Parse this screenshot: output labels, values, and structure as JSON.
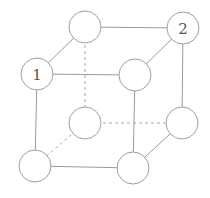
{
  "diagram": {
    "type": "cube-graph",
    "nodes": [
      {
        "id": "back-top-left",
        "x": 85,
        "y": 27,
        "r": 16,
        "label": ""
      },
      {
        "id": "back-top-right",
        "x": 183,
        "y": 28,
        "r": 16,
        "label": "2"
      },
      {
        "id": "front-top-left",
        "x": 37,
        "y": 74,
        "r": 16,
        "label": "1"
      },
      {
        "id": "front-top-right",
        "x": 135,
        "y": 75,
        "r": 16,
        "label": ""
      },
      {
        "id": "back-bottom-left",
        "x": 85,
        "y": 123,
        "r": 16,
        "label": ""
      },
      {
        "id": "back-bottom-right",
        "x": 182,
        "y": 123,
        "r": 16,
        "label": ""
      },
      {
        "id": "front-bottom-left",
        "x": 35,
        "y": 166,
        "r": 16,
        "label": ""
      },
      {
        "id": "front-bottom-right",
        "x": 133,
        "y": 168,
        "r": 16,
        "label": ""
      }
    ],
    "edges": [
      {
        "from": "back-top-left",
        "to": "back-top-right",
        "style": "solid"
      },
      {
        "from": "back-top-left",
        "to": "front-top-left",
        "style": "solid"
      },
      {
        "from": "back-top-right",
        "to": "front-top-right",
        "style": "solid"
      },
      {
        "from": "front-top-left",
        "to": "front-top-right",
        "style": "solid"
      },
      {
        "from": "front-top-left",
        "to": "front-bottom-left",
        "style": "solid"
      },
      {
        "from": "front-top-right",
        "to": "front-bottom-right",
        "style": "solid"
      },
      {
        "from": "back-top-right",
        "to": "back-bottom-right",
        "style": "solid"
      },
      {
        "from": "front-bottom-left",
        "to": "front-bottom-right",
        "style": "solid"
      },
      {
        "from": "front-bottom-right",
        "to": "back-bottom-right",
        "style": "solid"
      },
      {
        "from": "back-top-left",
        "to": "back-bottom-left",
        "style": "dashed"
      },
      {
        "from": "back-bottom-left",
        "to": "back-bottom-right",
        "style": "dashed"
      },
      {
        "from": "back-bottom-left",
        "to": "front-bottom-left",
        "style": "dashed"
      }
    ],
    "colors": {
      "stroke": "#a0a0a0",
      "label": "#555555",
      "background": "#ffffff"
    }
  }
}
